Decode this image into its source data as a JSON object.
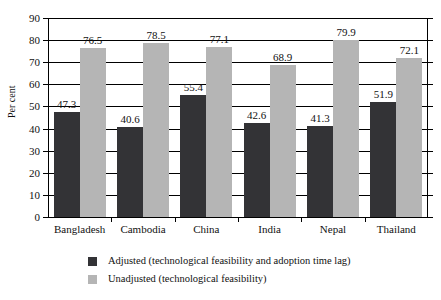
{
  "chart_data": {
    "type": "bar",
    "title": "",
    "xlabel": "",
    "ylabel": "Per cent",
    "ylim": [
      0,
      90
    ],
    "ytick_step": 10,
    "yticks": [
      90,
      80,
      70,
      60,
      50,
      40,
      30,
      20,
      10,
      0
    ],
    "grid": true,
    "legend_position": "bottom",
    "categories": [
      "Bangladesh",
      "Cambodia",
      "China",
      "India",
      "Nepal",
      "Thailand"
    ],
    "series": [
      {
        "name": "Adjusted (technological feasibility and adoption time lag)",
        "color": "#333336",
        "values": [
          47.3,
          40.6,
          55.4,
          42.6,
          41.3,
          51.9
        ],
        "labels": [
          "47.3",
          "40.6",
          "55.4",
          "42.6",
          "41.3",
          "51.9"
        ]
      },
      {
        "name": "Unadjusted (technological feasibility)",
        "color": "#b5b5b5",
        "values": [
          76.5,
          78.5,
          77.1,
          68.9,
          79.9,
          72.1
        ],
        "labels": [
          "76.5",
          "78.5",
          "77.1",
          "68.9",
          "79.9",
          "72.1"
        ]
      }
    ]
  },
  "axis": {
    "y_title": "Per cent"
  },
  "legend": {
    "items": [
      {
        "label": "Adjusted (technological feasibility and adoption time lag)",
        "color": "#333336"
      },
      {
        "label": "Unadjusted (technological feasibility)",
        "color": "#b5b5b5"
      }
    ]
  }
}
